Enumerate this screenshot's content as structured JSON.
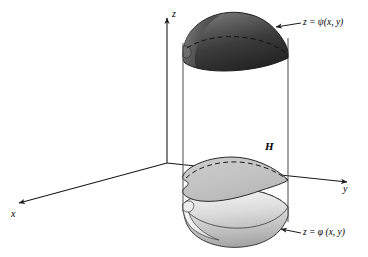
{
  "figure": {
    "kind": "3d-solid-region-diagram",
    "width": 368,
    "height": 257,
    "background_color": "#ffffff",
    "stroke_color": "#1a1a1a"
  },
  "axes": {
    "origin": {
      "x": 167,
      "y": 163
    },
    "items": [
      {
        "name": "z-axis",
        "label": "z",
        "direction": "up",
        "tip": {
          "x": 167,
          "y": 14
        }
      },
      {
        "name": "y-axis",
        "label": "y",
        "direction": "right",
        "tip": {
          "x": 352,
          "y": 182
        }
      },
      {
        "name": "x-axis",
        "label": "x",
        "direction": "down-left",
        "tip": {
          "x": 14,
          "y": 205
        }
      }
    ]
  },
  "solid": {
    "name": "cylindrical-solid",
    "left_wall_x": 183,
    "right_wall_x": 288,
    "top_surface": {
      "name": "upper-surface",
      "label": "z = ψ(x, y)",
      "fill_top": "#5a5a5a",
      "fill_bottom": "#2b2b2b"
    },
    "bottom_surface": {
      "name": "lower-surface",
      "label": "z = φ (x, y)",
      "fill_top": "#efefef",
      "fill_bottom": "#b4b4b4"
    },
    "mid_region": {
      "name": "projection-region",
      "label": "H",
      "fill": "#c4c4c4"
    }
  },
  "callouts": [
    {
      "name": "upper-surface-callout",
      "text": "z = ψ(x, y)",
      "arrow_from": {
        "x": 300,
        "y": 23
      },
      "arrow_to": {
        "x": 274,
        "y": 27
      }
    },
    {
      "name": "lower-surface-callout",
      "text": "z = φ (x, y)",
      "arrow_from": {
        "x": 300,
        "y": 233
      },
      "arrow_to": {
        "x": 279,
        "y": 228
      }
    }
  ],
  "labels": {
    "z": "z",
    "y": "y",
    "x": "x",
    "H": "H",
    "psi": "z = ψ(x, y)",
    "phi": "z = φ (x, y)"
  }
}
